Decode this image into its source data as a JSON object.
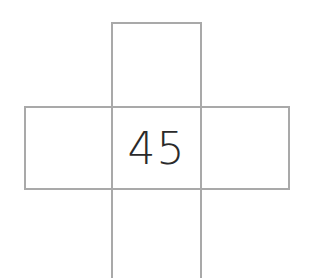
{
  "diagram": {
    "type": "cross-grid",
    "cells": {
      "top": "",
      "left": "",
      "center": "45",
      "right": "",
      "bottom": ""
    },
    "colors": {
      "line": "#a9a9a9",
      "text": "#2a2a2a",
      "background": "#ffffff"
    }
  }
}
